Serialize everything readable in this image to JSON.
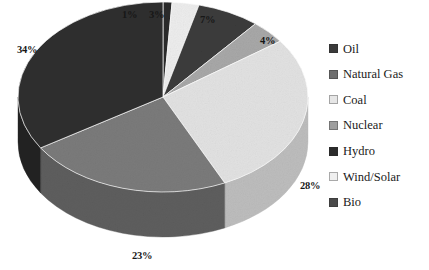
{
  "chart_data": {
    "type": "pie",
    "title": "",
    "subtitle": "",
    "xlabel": "",
    "ylabel": "",
    "legend_position": "right",
    "grid": false,
    "three_d": true,
    "categories": [
      "Oil",
      "Natural Gas",
      "Coal",
      "Nuclear",
      "Hydro",
      "Wind/Solar",
      "Bio"
    ],
    "values": [
      34,
      23,
      28,
      4,
      1,
      3,
      7
    ],
    "value_labels": [
      "34%",
      "23%",
      "28%",
      "4%",
      "1%",
      "3%",
      "7%"
    ],
    "total": 100,
    "units": "percent",
    "colors": [
      "#2f2f2f",
      "#7b7b7b",
      "#e2e2e2",
      "#a8a8a8",
      "#2a2a2a",
      "#ededed",
      "#3c3c3c"
    ],
    "slices": [
      {
        "label": "Oil",
        "value": 34,
        "value_label": "34%",
        "color": "#2f2f2f",
        "side_color": "#242424"
      },
      {
        "label": "Natural Gas",
        "value": 23,
        "value_label": "23%",
        "color": "#7b7b7b",
        "side_color": "#5e5e5e"
      },
      {
        "label": "Coal",
        "value": 28,
        "value_label": "28%",
        "color": "#e2e2e2",
        "side_color": "#bdbdbd"
      },
      {
        "label": "Nuclear",
        "value": 4,
        "value_label": "4%",
        "color": "#a8a8a8",
        "side_color": "#828282"
      },
      {
        "label": "Hydro",
        "value": 1,
        "value_label": "1%",
        "color": "#2a2a2a",
        "side_color": "#202020"
      },
      {
        "label": "Wind/Solar",
        "value": 3,
        "value_label": "3%",
        "color": "#ededed",
        "side_color": "#c6c6c6"
      },
      {
        "label": "Bio",
        "value": 7,
        "value_label": "7%",
        "color": "#3c3c3c",
        "side_color": "#2d2d2d"
      }
    ]
  },
  "legend": {
    "items": [
      {
        "label": "Oil",
        "color": "#3a3a3a"
      },
      {
        "label": "Natural Gas",
        "color": "#6f6f6f"
      },
      {
        "label": "Coal",
        "color": "#e6e6e6"
      },
      {
        "label": "Nuclear",
        "color": "#9e9e9e"
      },
      {
        "label": "Hydro",
        "color": "#2b2b2b"
      },
      {
        "label": "Wind/Solar",
        "color": "#efefef"
      },
      {
        "label": "Bio",
        "color": "#4a4a4a"
      }
    ]
  },
  "callouts": [
    {
      "name": "hydro",
      "text": "1%",
      "x": 122,
      "y": 9
    },
    {
      "name": "wind-solar",
      "text": "3%",
      "x": 149,
      "y": 9
    },
    {
      "name": "bio",
      "text": "7%",
      "x": 200,
      "y": 14
    },
    {
      "name": "nuclear",
      "text": "4%",
      "x": 260,
      "y": 35
    },
    {
      "name": "coal",
      "text": "28%",
      "x": 300,
      "y": 180
    },
    {
      "name": "natural-gas",
      "text": "23%",
      "x": 132,
      "y": 250
    },
    {
      "name": "oil",
      "text": "34%",
      "x": 17,
      "y": 44
    }
  ]
}
